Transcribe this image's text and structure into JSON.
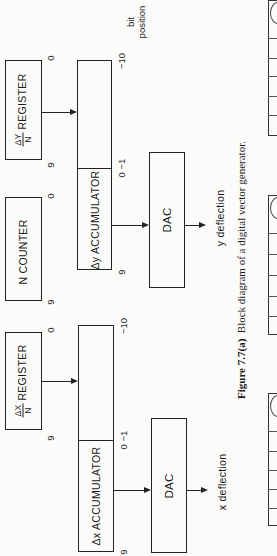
{
  "figure": {
    "caption_label": "Figure 7.7(a)",
    "caption_text": "Block diagram of a digital vector generator.",
    "bit_position_label": [
      "bit",
      "position"
    ]
  },
  "blocks": {
    "dy_register": {
      "frac_top": "ΔY",
      "frac_bottom": "N",
      "label": "REGISTER",
      "bit_high": "9",
      "bit_low": "0"
    },
    "n_counter": {
      "label": "N COUNTER",
      "bit_high": "9",
      "bit_low": "0"
    },
    "dx_register": {
      "frac_top": "ΔX",
      "frac_bottom": "N",
      "label": "REGISTER",
      "bit_high": "9",
      "bit_low": "0"
    },
    "dy_accumulator": {
      "label": "Δy ACCUMULATOR",
      "bit_high": "9",
      "bit_mid": "0  −1",
      "bit_low": "−10"
    },
    "dx_accumulator": {
      "label": "Δx ACCUMULATOR",
      "bit_high": "9",
      "bit_mid": "0  −1",
      "bit_low": "−10"
    },
    "y_dac": {
      "label": "DAC",
      "output": "y deflection"
    },
    "x_dac": {
      "label": "DAC",
      "output": "x deflection"
    }
  }
}
